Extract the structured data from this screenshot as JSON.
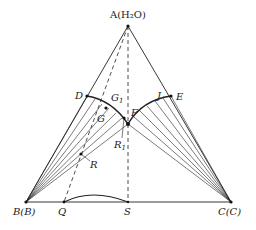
{
  "labels": {
    "A": "A(H₂O)",
    "B": "B(B)",
    "C": "C(C)",
    "D": "D",
    "E": "E",
    "F": "F",
    "G1": "G",
    "G1_sub": "1",
    "G": "G",
    "J": "J",
    "R": "R",
    "R1": "R",
    "R1_sub": "1",
    "Q": "Q",
    "S": "S"
  },
  "points": {
    "A": [
      128,
      26
    ],
    "B": [
      26,
      202
    ],
    "C": [
      231,
      202
    ],
    "D": [
      87,
      96
    ],
    "E": [
      171,
      96
    ],
    "F": [
      128,
      124
    ],
    "G1": [
      106,
      108
    ],
    "J": [
      161,
      99
    ],
    "R": [
      81,
      154
    ],
    "R1": [
      124,
      118
    ],
    "Q": [
      64,
      202
    ],
    "S": [
      128,
      202
    ]
  },
  "colors": {
    "line": "#222222",
    "background": "#ffffff"
  }
}
